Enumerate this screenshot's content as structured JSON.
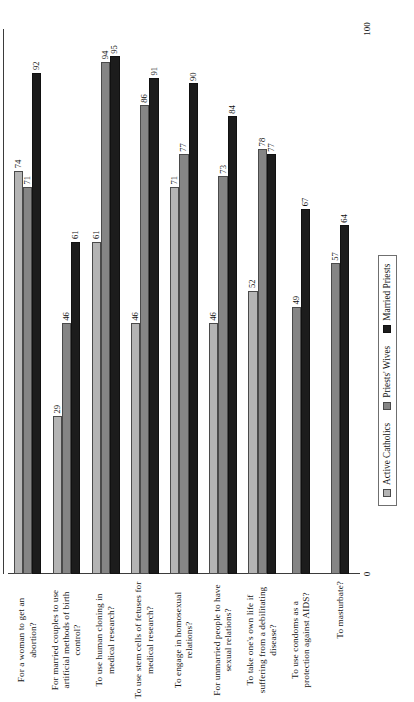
{
  "chart_data": {
    "type": "bar",
    "orientation": "horizontal",
    "title": "",
    "subtitle": "",
    "xlabel": "",
    "ylabel": "",
    "xlim": [
      0,
      100
    ],
    "grid": false,
    "legend_position": "bottom",
    "axis_ticks": [
      "0",
      "100"
    ],
    "categories": [
      "For a woman to get an abortion?",
      "For married couples to use artificial methods of birth control?",
      "To use human cloning in medical research?",
      "To use stem cells of fetuses for medical research?",
      "To engage in homosexual relations?",
      "For unmarried people to have sexual relations?",
      "To take one's own life if suffering from a debilitating disease?",
      "To use condoms as a protection against AIDS?",
      "To masturbate?"
    ],
    "series": [
      {
        "name": "Active Catholics",
        "color": "#b4b4b4",
        "values": [
          74,
          29,
          61,
          46,
          71,
          46,
          52,
          null,
          null
        ]
      },
      {
        "name": "Priests' Wives",
        "color": "#858585",
        "values": [
          71,
          46,
          94,
          86,
          77,
          73,
          78,
          49,
          57
        ]
      },
      {
        "name": "Married Priests",
        "color": "#1c1c1c",
        "values": [
          92,
          61,
          95,
          91,
          90,
          84,
          77,
          67,
          64
        ]
      }
    ]
  },
  "legend": {
    "items": [
      {
        "label": "Active Catholics",
        "swatch": "s0"
      },
      {
        "label": "Priests' Wives",
        "swatch": "s1"
      },
      {
        "label": "Married Priests",
        "swatch": "s2"
      }
    ]
  },
  "scale": {
    "min_label": "0",
    "max_label": "100"
  }
}
